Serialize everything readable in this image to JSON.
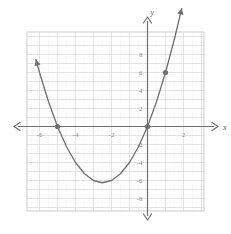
{
  "figure": {
    "title": "",
    "background_color": "#ffffff",
    "plot_box": {
      "left": 27,
      "top": 32,
      "width": 177,
      "height": 179
    },
    "colors": {
      "curve": "#6f6f6f",
      "axis": "#6f6f6f",
      "major_grid": "#d9d9d9",
      "minor_grid": "#eeeeee",
      "border": "#cccccc",
      "point": "#707070",
      "tick_text": "#8a8a8a"
    }
  },
  "axes": {
    "x_axis_label": "x",
    "y_axis_label": "y",
    "x_ticks": [
      {
        "value": -6,
        "label": "-6"
      },
      {
        "value": -4,
        "label": "-4"
      },
      {
        "value": -2,
        "label": "-2"
      },
      {
        "value": 2,
        "label": "2"
      }
    ],
    "y_ticks": [
      {
        "value": 8,
        "label": "8"
      },
      {
        "value": 6,
        "label": "6"
      },
      {
        "value": 4,
        "label": "4"
      },
      {
        "value": 2,
        "label": "2"
      },
      {
        "value": -2,
        "label": "-2"
      },
      {
        "value": -4,
        "label": "-4"
      },
      {
        "value": -6,
        "label": "-6"
      },
      {
        "value": -8,
        "label": "-8"
      }
    ],
    "xlim": [
      -6.7,
      3.2
    ],
    "ylim": [
      -10.5,
      9.4
    ],
    "grid": true,
    "arrowheads": [
      "left",
      "right",
      "up",
      "down"
    ]
  },
  "chart_data": {
    "type": "line",
    "title": "",
    "xlabel": "x",
    "ylabel": "y",
    "xlim": [
      -6.7,
      3.2
    ],
    "ylim": [
      -10.5,
      9.4
    ],
    "grid": true,
    "legend": null,
    "series": [
      {
        "name": "parabola",
        "kind": "quadratic",
        "equation": "y = x^2 + 5x",
        "color": "#6f6f6f",
        "vertex": [
          -2.5,
          -6.25
        ],
        "roots": [
          -5,
          0
        ],
        "x": [
          -6.2,
          -6.0,
          -5.5,
          -5.0,
          -4.5,
          -4.0,
          -3.5,
          -3.0,
          -2.5,
          -2.0,
          -1.5,
          -1.0,
          -0.5,
          0.0,
          0.5,
          1.0,
          1.5,
          1.9
        ],
        "values": [
          7.44,
          6.0,
          2.75,
          0.0,
          -2.25,
          -4.0,
          -5.25,
          -6.0,
          -6.25,
          -6.0,
          -5.25,
          -4.0,
          -2.25,
          0.0,
          2.75,
          6.0,
          9.75,
          13.11
        ]
      }
    ],
    "points": [
      {
        "x": -5,
        "y": 0,
        "label": ""
      },
      {
        "x": 0,
        "y": 0,
        "label": ""
      },
      {
        "x": 1,
        "y": 6,
        "label": ""
      }
    ],
    "x_tick_labels": [
      "-6",
      "-4",
      "-2",
      "2"
    ],
    "y_tick_labels": [
      "8",
      "6",
      "4",
      "2",
      "-2",
      "-4",
      "-6",
      "-8"
    ]
  }
}
